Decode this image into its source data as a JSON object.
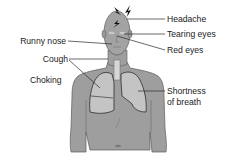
{
  "diagram": {
    "colors": {
      "skin": "#9e9e9e",
      "lungs": "#c4c4c4",
      "outline": "#3a3a3a",
      "text": "#1a1a1a",
      "background": "#ffffff"
    },
    "icons": [
      "lightning-bolt-icon",
      "lightning-bolt-icon",
      "lightning-bolt-icon"
    ],
    "labels": {
      "headache": "Headache",
      "tearing_eyes": "Tearing eyes",
      "red_eyes": "Red eyes",
      "runny_nose": "Runny nose",
      "cough": "Cough",
      "choking": "Choking",
      "shortness_line1": "Shortness",
      "shortness_line2": "of breath"
    }
  }
}
